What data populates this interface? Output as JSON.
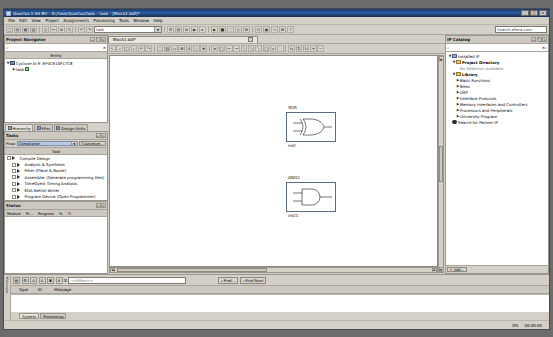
{
  "window": {
    "title": "Quartus II 64-Bit - D:/task/Quartus/task - task - [Block1.bdf]*",
    "minimize_label": "_",
    "maximize_label": "□",
    "close_label": "×"
  },
  "menubar": {
    "items": [
      "File",
      "Edit",
      "View",
      "Project",
      "Assignments",
      "Processing",
      "Tools",
      "Window",
      "Help"
    ]
  },
  "main_toolbar": {
    "buttons": [
      {
        "name": "new-file-button",
        "glyph": "□"
      },
      {
        "name": "open-file-button",
        "glyph": "▤"
      },
      {
        "name": "save-file-button",
        "glyph": "▦"
      },
      {
        "name": "save-all-button",
        "glyph": "▧"
      },
      {
        "name": "print-button",
        "glyph": "⎙"
      },
      {
        "name": "cut-button",
        "glyph": "✂"
      },
      {
        "name": "copy-button",
        "glyph": "⧉"
      },
      {
        "name": "paste-button",
        "glyph": "⎘"
      },
      {
        "name": "undo-button",
        "glyph": "↶"
      },
      {
        "name": "redo-button",
        "glyph": "↷"
      }
    ],
    "project_combo_value": "task",
    "project_combo_arrow": "▼",
    "right_buttons": [
      {
        "name": "settings-button",
        "glyph": "⚙"
      },
      {
        "name": "assignment-editor-button",
        "glyph": "▤"
      },
      {
        "name": "pin-planner-button",
        "glyph": "⧉"
      },
      {
        "name": "compile-button",
        "glyph": "▶"
      },
      {
        "name": "start-analysis-button",
        "glyph": "▸"
      },
      {
        "name": "start-compilation-button",
        "glyph": "▶"
      },
      {
        "name": "stop-button",
        "glyph": "■"
      },
      {
        "name": "programmer-button",
        "glyph": "⬚"
      },
      {
        "name": "timing-analyzer-button",
        "glyph": "◴"
      },
      {
        "name": "rtl-viewer-button",
        "glyph": "⊞"
      },
      {
        "name": "technology-map-button",
        "glyph": "⊡"
      },
      {
        "name": "chip-planner-button",
        "glyph": "▣"
      },
      {
        "name": "signaltap-button",
        "glyph": "∿"
      },
      {
        "name": "megawizard-button",
        "glyph": "⌘"
      },
      {
        "name": "help-button",
        "glyph": "?"
      }
    ],
    "search_placeholder": "Search altera.com"
  },
  "project_navigator": {
    "title": "Project Navigator",
    "pin_label": "↤",
    "float_label": "❐",
    "close_label": "×",
    "search_placeholder": "",
    "search_icon": "⌕",
    "clear_icon": "×",
    "column_header": "Entity",
    "device_expander": "▼",
    "device": "Cyclone IV E: EP4CE10F17C8",
    "entity_expander": "▶",
    "entity": "task",
    "tabs": [
      {
        "label": "Hierarchy",
        "active": true
      },
      {
        "label": "Files",
        "active": false
      },
      {
        "label": "Design Units",
        "active": false
      }
    ]
  },
  "tasks": {
    "title": "Tasks",
    "pin_label": "↤",
    "close_label": "×",
    "flow_label": "Flow:",
    "flow_value": "Compilation",
    "flow_arrow": "▼",
    "customize_button": "Customize...",
    "column_header": "Task",
    "items": [
      {
        "label": "Compile Design",
        "indent": 0,
        "expander": "▼"
      },
      {
        "label": "Analysis & Synthesis",
        "indent": 1,
        "expander": "▶"
      },
      {
        "label": "Fitter (Place & Route)",
        "indent": 1,
        "expander": "▶"
      },
      {
        "label": "Assembler (Generate programming files)",
        "indent": 1,
        "expander": "▶"
      },
      {
        "label": "TimeQuest Timing Analysis",
        "indent": 1,
        "expander": "▶"
      },
      {
        "label": "EDA Netlist Writer",
        "indent": 1,
        "expander": "▶"
      },
      {
        "label": "Program Device (Open Programmer)",
        "indent": 1,
        "expander": ""
      }
    ]
  },
  "status_panel": {
    "title": "Status",
    "pin_label": "↤",
    "close_label": "×",
    "columns": [
      "Module",
      "Pr...",
      "Progress",
      "%",
      "Ti"
    ]
  },
  "editor": {
    "tab_label": "Block1.bdf*",
    "tab_close": "□",
    "toolbar_buttons": [
      {
        "name": "pointer-tool",
        "glyph": "↖"
      },
      {
        "name": "zoom-tool",
        "glyph": "⌕"
      },
      {
        "name": "fit-page-tool",
        "glyph": "▢"
      },
      {
        "name": "find-tool",
        "glyph": "⌕"
      },
      {
        "name": "undo-tool",
        "glyph": "↶"
      },
      {
        "name": "redo-tool",
        "glyph": "↷"
      },
      {
        "name": "select-tool",
        "glyph": "⬚"
      },
      {
        "name": "symbol-tool",
        "glyph": "▧"
      },
      {
        "name": "block-tool",
        "glyph": "▭"
      },
      {
        "name": "megafunction-tool",
        "glyph": "⌘"
      },
      {
        "name": "text-tool",
        "glyph": "A"
      },
      {
        "name": "node-tool",
        "glyph": "○"
      },
      {
        "name": "bus-tool",
        "glyph": "≡"
      },
      {
        "name": "conduit-tool",
        "glyph": "⪰"
      },
      {
        "name": "rectangle-tool",
        "glyph": "□"
      },
      {
        "name": "orthogonal-node-tool",
        "glyph": "⌐"
      },
      {
        "name": "orthogonal-bus-tool",
        "glyph": "¬"
      },
      {
        "name": "diagonal-node-tool",
        "glyph": "╲"
      },
      {
        "name": "diagonal-bus-tool",
        "glyph": "╲"
      },
      {
        "name": "diagonal-conduit-tool",
        "glyph": "╲"
      },
      {
        "name": "rubber-band-tool",
        "glyph": "□"
      },
      {
        "name": "partial-line-tool",
        "glyph": "▫"
      },
      {
        "name": "arc-tool",
        "glyph": "◝"
      },
      {
        "name": "flip-horizontal-tool",
        "glyph": "⇆"
      },
      {
        "name": "flip-vertical-tool",
        "glyph": "⇅"
      },
      {
        "name": "rotate-tool",
        "glyph": "↻"
      },
      {
        "name": "zoom-in-tool",
        "glyph": "+"
      },
      {
        "name": "zoom-out-tool",
        "glyph": "−"
      }
    ],
    "gates": [
      {
        "name": "XOR",
        "instance": "inst",
        "type": "xor",
        "x": 176,
        "y": 56
      },
      {
        "name": "AND2",
        "instance": "inst1",
        "type": "and",
        "x": 176,
        "y": 126
      }
    ],
    "hscroll_left": "◀",
    "hscroll_right": "▶",
    "vscroll_up": "▲",
    "vscroll_down": "▼"
  },
  "ip_catalog": {
    "title": "IP Catalog",
    "pin_label": "↤",
    "float_label": "❐",
    "close_label": "×",
    "search_icon": "⌕",
    "clear_icon": "×",
    "search_button": "⌕",
    "items": [
      {
        "label": "Installed IP",
        "indent": 0,
        "expander": "▼",
        "icon": "hierarchy-icon"
      },
      {
        "label": "Project Directory",
        "indent": 1,
        "expander": "▼",
        "icon": "folder-icon",
        "bold": true
      },
      {
        "label": "No Selection Available",
        "indent": 2,
        "expander": "",
        "icon": "",
        "muted": true
      },
      {
        "label": "Library",
        "indent": 1,
        "expander": "▼",
        "icon": "folder-icon",
        "bold": true
      },
      {
        "label": "Basic Functions",
        "indent": 2,
        "expander": "▶",
        "icon": ""
      },
      {
        "label": "Bites",
        "indent": 2,
        "expander": "▶",
        "icon": ""
      },
      {
        "label": "DSP",
        "indent": 2,
        "expander": "▶",
        "icon": ""
      },
      {
        "label": "Interface Protocols",
        "indent": 2,
        "expander": "▶",
        "icon": ""
      },
      {
        "label": "Memory Interfaces and Controllers",
        "indent": 2,
        "expander": "▶",
        "icon": ""
      },
      {
        "label": "Processors and Peripherals",
        "indent": 2,
        "expander": "▶",
        "icon": ""
      },
      {
        "label": "University Program",
        "indent": 2,
        "expander": "▶",
        "icon": ""
      },
      {
        "label": "Search for Partner IP",
        "indent": 0,
        "expander": "",
        "icon": "globe-icon"
      }
    ],
    "add_button": "+ Add..."
  },
  "messages": {
    "vertical_tabs": [
      "Messages"
    ],
    "toolbar_buttons": [
      {
        "name": "all-messages-button",
        "glyph": "▤"
      },
      {
        "name": "system-messages-button",
        "glyph": "⚙"
      },
      {
        "name": "warning-messages-button",
        "glyph": "⚠"
      },
      {
        "name": "critical-warning-button",
        "glyph": "⚠"
      },
      {
        "name": "error-messages-button",
        "glyph": "✖"
      },
      {
        "name": "info-messages-button",
        "glyph": "ℹ"
      }
    ],
    "filter_icon": "∇",
    "filter_placeholder": "<<Filter>>",
    "find_button": "Find...",
    "find_next_button": "Find Next",
    "find_icon": "⌕",
    "columns": [
      "Type",
      "ID",
      "Message"
    ],
    "rows": [],
    "tabs": [
      {
        "label": "System",
        "active": true
      },
      {
        "label": "Processing",
        "active": false
      }
    ]
  },
  "statusbar": {
    "left": "",
    "items": [
      "0%",
      "00:00:00"
    ]
  }
}
